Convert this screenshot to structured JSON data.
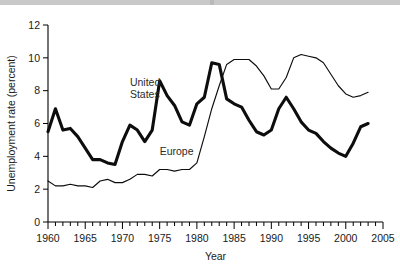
{
  "chart_data": {
    "type": "line",
    "title": "",
    "xlabel": "Year",
    "ylabel": "Unemployment rate (percent)",
    "xlim": [
      1960,
      2005
    ],
    "ylim": [
      0,
      12
    ],
    "ytick_labels": [
      "0",
      "2",
      "4",
      "6",
      "8",
      "10",
      "12"
    ],
    "yticks": [
      0,
      2,
      4,
      6,
      8,
      10,
      12
    ],
    "xtick_labels": [
      "1960",
      "1965",
      "1970",
      "1975",
      "1980",
      "1985",
      "1990",
      "1995",
      "2000",
      "2005"
    ],
    "xticks": [
      1960,
      1965,
      1970,
      1975,
      1980,
      1985,
      1990,
      1995,
      2000,
      2005
    ],
    "minor_xtick_interval": 1,
    "grid": false,
    "legend": "inline-annotations",
    "x": [
      1960,
      1961,
      1962,
      1963,
      1964,
      1965,
      1966,
      1967,
      1968,
      1969,
      1970,
      1971,
      1972,
      1973,
      1974,
      1975,
      1976,
      1977,
      1978,
      1979,
      1980,
      1981,
      1982,
      1983,
      1984,
      1985,
      1986,
      1987,
      1988,
      1989,
      1990,
      1991,
      1992,
      1993,
      1994,
      1995,
      1996,
      1997,
      1998,
      1999,
      2000,
      2001,
      2002,
      2003
    ],
    "series": [
      {
        "name": "United States",
        "style": "thick",
        "values": [
          5.5,
          6.9,
          5.6,
          5.7,
          5.2,
          4.5,
          3.8,
          3.8,
          3.6,
          3.5,
          4.9,
          5.9,
          5.6,
          4.9,
          5.6,
          8.6,
          7.7,
          7.1,
          6.1,
          5.9,
          7.2,
          7.6,
          9.7,
          9.6,
          7.5,
          7.2,
          7.0,
          6.2,
          5.5,
          5.3,
          5.6,
          6.9,
          7.6,
          6.9,
          6.1,
          5.6,
          5.4,
          4.9,
          4.5,
          4.2,
          4.0,
          4.8,
          5.8,
          6.0
        ]
      },
      {
        "name": "Europe",
        "style": "thin",
        "values": [
          2.5,
          2.2,
          2.2,
          2.3,
          2.2,
          2.2,
          2.1,
          2.5,
          2.6,
          2.4,
          2.4,
          2.6,
          2.9,
          2.9,
          2.8,
          3.2,
          3.2,
          3.1,
          3.2,
          3.2,
          3.6,
          5.2,
          6.9,
          8.3,
          9.6,
          9.9,
          9.9,
          9.9,
          9.5,
          8.9,
          8.1,
          8.1,
          8.8,
          10.0,
          10.2,
          10.1,
          10.0,
          9.7,
          9.0,
          8.3,
          7.8,
          7.6,
          7.7,
          7.9
        ]
      }
    ],
    "annotations": [
      {
        "text": "United States",
        "line1": "United",
        "line2": "States",
        "x": 1971,
        "y": 8.3
      },
      {
        "text": "Europe",
        "x": 1975,
        "y": 4.1
      }
    ]
  },
  "figure": {
    "caption": ""
  }
}
